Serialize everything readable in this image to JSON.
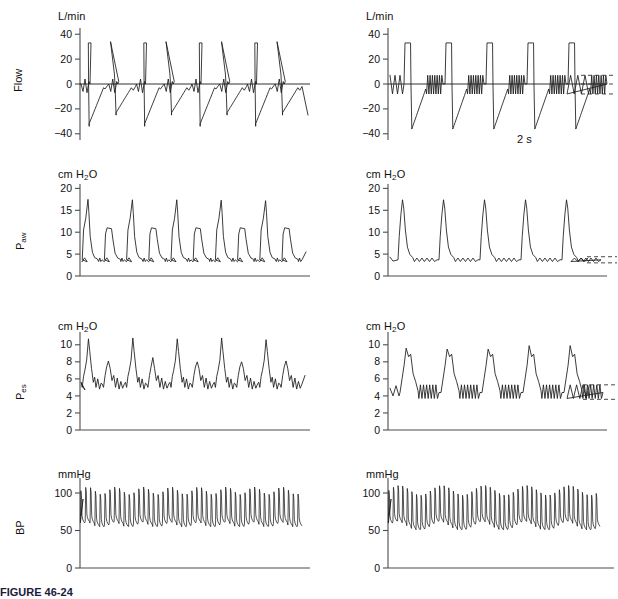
{
  "figure": {
    "caption": "FIGURE 46-24",
    "time_scale_label": "2 s",
    "background": "#ffffff",
    "trace_color": "#1a1a1a",
    "axis_color": "#4d4d4d"
  },
  "panels": [
    {
      "id": "flow-left",
      "row": "Flow",
      "column": "left",
      "axis_label": "Flow",
      "unit_label": "L/min",
      "unit_sub": "",
      "ticks": [
        40,
        20,
        0,
        -20,
        -40
      ],
      "tick_labels": [
        "40",
        "20",
        "0",
        "−20",
        "−40"
      ],
      "has_zero_line": true,
      "has_dashed_markers": false
    },
    {
      "id": "flow-right",
      "row": "Flow",
      "column": "right",
      "axis_label": "",
      "unit_label": "L/min",
      "unit_sub": "",
      "ticks": [
        40,
        20,
        0,
        -20,
        -40
      ],
      "tick_labels": [
        "40",
        "20",
        "0",
        "−20",
        "−40"
      ],
      "has_zero_line": true,
      "has_dashed_markers": true
    },
    {
      "id": "paw-left",
      "row": "Paw",
      "column": "left",
      "axis_label": "P",
      "axis_label_sub": "aw",
      "unit_label": "cm H",
      "unit_sub": "2",
      "unit_label_tail": "O",
      "ticks": [
        20,
        15,
        10,
        5,
        0
      ],
      "tick_labels": [
        "20",
        "15",
        "10",
        "5",
        "0"
      ],
      "has_zero_line": false,
      "has_dashed_markers": false
    },
    {
      "id": "paw-right",
      "row": "Paw",
      "column": "right",
      "axis_label": "",
      "unit_label": "cm H",
      "unit_sub": "2",
      "unit_label_tail": "O",
      "ticks": [
        20,
        15,
        10,
        5,
        0
      ],
      "tick_labels": [
        "20",
        "15",
        "10",
        "5",
        "0"
      ],
      "has_zero_line": false,
      "has_dashed_markers": true
    },
    {
      "id": "pes-left",
      "row": "Pes",
      "column": "left",
      "axis_label": "P",
      "axis_label_sub": "es",
      "unit_label": "cm H",
      "unit_sub": "2",
      "unit_label_tail": "O",
      "ticks": [
        10,
        8,
        6,
        4,
        2,
        0
      ],
      "tick_labels": [
        "10",
        "8",
        "6",
        "4",
        "2",
        "0"
      ],
      "has_zero_line": false,
      "has_dashed_markers": false
    },
    {
      "id": "pes-right",
      "row": "Pes",
      "column": "right",
      "axis_label": "",
      "unit_label": "cm H",
      "unit_sub": "2",
      "unit_label_tail": "O",
      "ticks": [
        10,
        8,
        6,
        4,
        2,
        0
      ],
      "tick_labels": [
        "10",
        "8",
        "6",
        "4",
        "2",
        "0"
      ],
      "has_zero_line": false,
      "has_dashed_markers": true
    },
    {
      "id": "bp-left",
      "row": "BP",
      "column": "left",
      "axis_label": "BP",
      "unit_label": "mmHg",
      "unit_sub": "",
      "ticks": [
        100,
        50,
        0
      ],
      "tick_labels": [
        "100",
        "50",
        "0"
      ],
      "has_zero_line": false,
      "has_dashed_markers": false
    },
    {
      "id": "bp-right",
      "row": "BP",
      "column": "right",
      "axis_label": "",
      "unit_label": "mmHg",
      "unit_sub": "",
      "ticks": [
        100,
        50,
        0
      ],
      "tick_labels": [
        "100",
        "50",
        "0"
      ],
      "has_zero_line": false,
      "has_dashed_markers": true
    }
  ],
  "chart_data": [
    {
      "type": "line",
      "id": "flow-left",
      "title": "",
      "ylabel": "Flow",
      "yunit": "L/min",
      "xlabel": "",
      "ylim": [
        -45,
        45
      ],
      "yticks": [
        40,
        20,
        0,
        -20,
        -40
      ],
      "grid": false,
      "legend": "none",
      "n_cycles": 8,
      "description": "Alternating mandatory square-wave inspiratory flow (plateau +33 L/min) and spontaneous/assisted triangular inspiratory peaks (+34 L/min), each followed by passive expiratory trough to -34 L/min.",
      "cycle_pattern": [
        {
          "kind": "square",
          "peak": 33,
          "trough": -34
        },
        {
          "kind": "spont",
          "peak": 34,
          "trough": -25
        }
      ],
      "peak_inspiratory_flow": 34,
      "plateau_flow": 33,
      "peak_expiratory_flow": -34
    },
    {
      "type": "line",
      "id": "flow-right",
      "title": "",
      "ylabel": "Flow",
      "yunit": "L/min",
      "xlabel": "",
      "ylim": [
        -45,
        45
      ],
      "yticks": [
        40,
        20,
        0,
        -20,
        -40
      ],
      "grid": false,
      "legend": "none",
      "n_cycles": 5,
      "description": "Five mandatory square-wave breaths (plateau +33 L/min, expiratory trough -35 L/min) separated by trains of small high-frequency spontaneous oscillations between +7 and -8 L/min.",
      "plateau_flow": 33,
      "peak_expiratory_flow": -35,
      "oscillation_amplitude": [
        7,
        -8
      ],
      "oscillations_per_interval": 7,
      "dashed_marker_levels": [
        7,
        0,
        -8
      ]
    },
    {
      "type": "line",
      "id": "paw-left",
      "title": "",
      "ylabel": "Paw",
      "yunit": "cm H2O",
      "xlabel": "",
      "ylim": [
        0,
        21
      ],
      "yticks": [
        20,
        15,
        10,
        5,
        0
      ],
      "grid": false,
      "legend": "none",
      "n_cycles": 8,
      "description": "Alternating large mandatory pressure peaks of 17.5 cm H2O and smaller pressure-support peaks of 11 cm H2O, returning to a PEEP baseline of about 3.7 cm H2O.",
      "peak_large": 17.5,
      "peak_small": 11,
      "peep_baseline": 3.7,
      "peak_sequence": [
        17.5,
        11,
        17.4,
        11,
        17.4,
        11,
        17.3,
        11,
        17.2,
        11
      ]
    },
    {
      "type": "line",
      "id": "paw-right",
      "title": "",
      "ylabel": "Paw",
      "yunit": "cm H2O",
      "xlabel": "",
      "ylim": [
        0,
        21
      ],
      "yticks": [
        20,
        15,
        10,
        5,
        0
      ],
      "grid": false,
      "legend": "none",
      "n_cycles": 5,
      "description": "Five mandatory pressure peaks of 17.4 cm H2O separated by a PEEP baseline of about 3.7 cm H2O bearing small spontaneous oscillations of roughly 0.8 cm H2O amplitude.",
      "peak_large": 17.4,
      "peep_baseline": 3.7,
      "oscillation_amplitude": 0.8,
      "dashed_marker_levels": [
        4.4,
        3.0
      ]
    },
    {
      "type": "line",
      "id": "pes-left",
      "title": "",
      "ylabel": "Pes",
      "yunit": "cm H2O",
      "xlabel": "",
      "ylim": [
        0,
        11.5
      ],
      "yticks": [
        10,
        8,
        6,
        4,
        2,
        0
      ],
      "grid": false,
      "legend": "none",
      "n_cycles": 8,
      "description": "Esophageal pressure oscillating between about 4.6 and 10.8 cm H2O; alternating tall peaks near 10.8 and lower peaks near 8.1, superimposed on cardiac ripple.",
      "peak_large": 10.8,
      "peak_small": 8.1,
      "baseline_min": 4.6,
      "peak_sequence": [
        10.7,
        8.1,
        10.8,
        8.5,
        10.7,
        8.0,
        10.8,
        8.0,
        10.6,
        8.1
      ]
    },
    {
      "type": "line",
      "id": "pes-right",
      "title": "",
      "ylabel": "Pes",
      "yunit": "cm H2O",
      "xlabel": "",
      "ylim": [
        0,
        11.5
      ],
      "yticks": [
        10,
        8,
        6,
        4,
        2,
        0
      ],
      "grid": false,
      "legend": "none",
      "n_cycles": 5,
      "description": "Five large esophageal pressure swings peaking at about 9.7 cm H2O separated by trains of small rapid oscillations between 3.7 and 5.3 cm H2O.",
      "peak_large": 9.7,
      "peak_sequence": [
        9.6,
        9.5,
        9.5,
        9.9,
        9.9
      ],
      "oscillation_range": [
        3.7,
        5.3
      ],
      "dashed_marker_levels": [
        5.3,
        3.6
      ]
    },
    {
      "type": "line",
      "id": "bp-left",
      "title": "",
      "ylabel": "BP",
      "yunit": "mmHg",
      "xlabel": "",
      "ylim": [
        0,
        120
      ],
      "yticks": [
        100,
        50,
        0
      ],
      "grid": false,
      "legend": "none",
      "n_beats": 46,
      "description": "Arterial blood pressure trace, systolic about 103 mmHg and diastolic about 57 mmHg, with mild respiratory variation in pulse amplitude.",
      "systolic_mean": 103,
      "diastolic_mean": 57,
      "systolic_range": [
        98,
        108
      ],
      "diastolic_range": [
        55,
        62
      ]
    },
    {
      "type": "line",
      "id": "bp-right",
      "title": "",
      "ylabel": "BP",
      "yunit": "mmHg",
      "xlabel": "",
      "ylim": [
        0,
        120
      ],
      "yticks": [
        100,
        50,
        0
      ],
      "grid": false,
      "legend": "none",
      "n_beats": 46,
      "description": "Arterial blood pressure trace, systolic about 104 mmHg and diastolic about 55 mmHg, showing larger respiratory swings in systolic pressure than the left panel.",
      "systolic_mean": 104,
      "diastolic_mean": 55,
      "systolic_range": [
        97,
        110
      ],
      "diastolic_range": [
        51,
        63
      ]
    }
  ]
}
